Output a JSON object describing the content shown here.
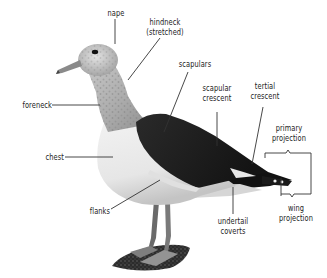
{
  "diagram": {
    "colors": {
      "background": "#ffffff",
      "text": "#222222",
      "leader_line": "#333333",
      "mantle": "#1e1e1e",
      "head_mottle": "#b8b8b8",
      "underparts": "#eeeeee",
      "legs": "#6a6a6a",
      "ground": "#3a3a3a"
    },
    "labels": {
      "nape": {
        "line1": "nape"
      },
      "hindneck": {
        "line1": "hindneck",
        "line2": "(stretched)"
      },
      "scapulars": {
        "line1": "scapulars"
      },
      "scapular_crescent": {
        "line1": "scapular",
        "line2": "crescent"
      },
      "tertial_crescent": {
        "line1": "tertial",
        "line2": "crescent"
      },
      "primary_projection": {
        "line1": "primary",
        "line2": "projection"
      },
      "foreneck": {
        "line1": "foreneck"
      },
      "chest": {
        "line1": "chest"
      },
      "flanks": {
        "line1": "flanks"
      },
      "undertail_coverts": {
        "line1": "undertail",
        "line2": "coverts"
      },
      "wing_projection": {
        "line1": "wing",
        "line2": "projection"
      }
    }
  }
}
